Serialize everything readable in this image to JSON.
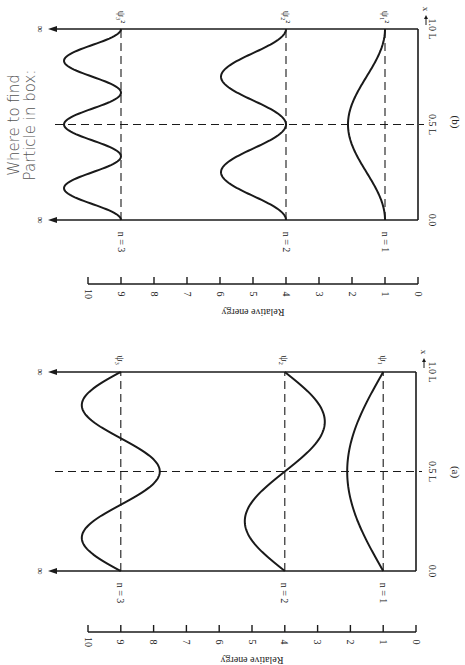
{
  "annotation": {
    "line1": "Where to find",
    "line2": "Particle in box:"
  },
  "panels": [
    {
      "id": "a",
      "caption": "(a)",
      "kind": "wavefunction",
      "energy_axis": {
        "label": "Relative energy",
        "ticks": [
          "0",
          "1",
          "2",
          "3",
          "4",
          "5",
          "6",
          "7",
          "8",
          "9",
          "10"
        ]
      },
      "position_axis": {
        "ticks": [
          "0.0",
          "0.5 L",
          "1.0 L"
        ],
        "arrow_label": "x"
      },
      "infinity_label": "∞",
      "levels": [
        {
          "n_label": "n = 1",
          "n": 1,
          "energy": 1,
          "psi_label": "ψ1",
          "curve_label": "ψ₁"
        },
        {
          "n_label": "n = 2",
          "n": 2,
          "energy": 4,
          "psi_label": "ψ2",
          "curve_label": "ψ₂"
        },
        {
          "n_label": "n = 3",
          "n": 3,
          "energy": 9,
          "psi_label": "ψ3",
          "curve_label": "ψ₃"
        }
      ]
    },
    {
      "id": "b",
      "caption": "(b)",
      "kind": "probability-density",
      "energy_axis": {
        "label": "Relative energy",
        "ticks": [
          "0",
          "1",
          "2",
          "3",
          "4",
          "5",
          "6",
          "7",
          "8",
          "9",
          "10"
        ]
      },
      "position_axis": {
        "ticks": [
          "0.0",
          "0.5 L",
          "1.0 L"
        ],
        "arrow_label": "x"
      },
      "infinity_label": "∞",
      "levels": [
        {
          "n_label": "n = 1",
          "n": 1,
          "energy": 1,
          "curve_label": "ψ₁²"
        },
        {
          "n_label": "n = 2",
          "n": 2,
          "energy": 4,
          "curve_label": "ψ₂²"
        },
        {
          "n_label": "n = 3",
          "n": 3,
          "energy": 9,
          "curve_label": "ψ₃²"
        }
      ]
    }
  ],
  "colors": {
    "ink": "#1a1a1a",
    "handwriting": "#555555",
    "background": "#ffffff"
  }
}
